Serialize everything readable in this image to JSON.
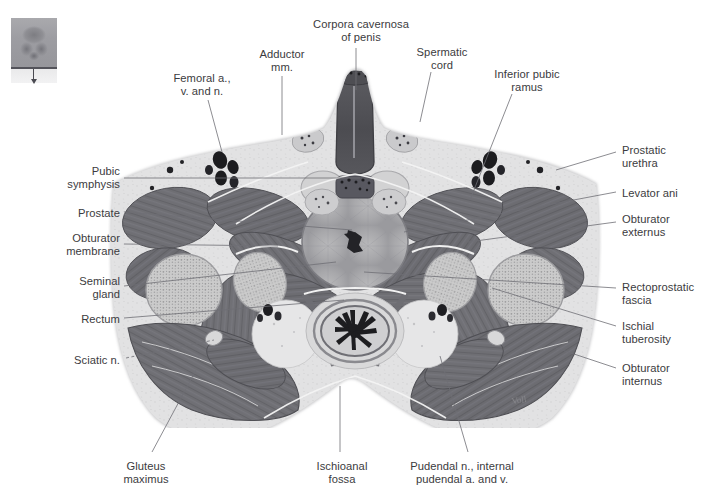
{
  "figure": {
    "type": "anatomical-cross-section",
    "plane": "transverse / axial",
    "modality": "anatomical plate, grayscale",
    "background_color": "#ffffff",
    "label_color": "#3b3b40",
    "leader_line_color": "#6f6f75",
    "tissue_colors": {
      "muscle": "#6e6e73",
      "fat_fascia": "#dcdcdc",
      "bone_marrow": "#c9c9c9",
      "skin_outline": "#b7b7b9",
      "vessel_lumen": "#1f1f22",
      "lumen_dark": "#2a2a2e"
    }
  },
  "thumbnail": {
    "name": "orientation-thumbnail",
    "description": "small pelvis overview with horizontal section line and downward viewing arrow"
  },
  "labels": {
    "top": [
      {
        "id": "corpora-cavernosa",
        "text": "Corpora cavernosa\nof penis",
        "align": "center",
        "x": 311,
        "y": 18,
        "w": 100
      },
      {
        "id": "adductor-mm",
        "text": "Adductor\nmm.",
        "align": "center",
        "x": 248,
        "y": 48,
        "w": 68
      },
      {
        "id": "spermatic-cord",
        "text": "Spermatic\ncord",
        "align": "center",
        "x": 409,
        "y": 46,
        "w": 66
      },
      {
        "id": "inferior-pubic-ramus",
        "text": "Inferior pubic\nramus",
        "align": "center",
        "x": 481,
        "y": 68,
        "w": 92
      },
      {
        "id": "femoral-avn",
        "text": "Femoral a.,\nv. and n.",
        "align": "center",
        "x": 163,
        "y": 72,
        "w": 78
      }
    ],
    "left": [
      {
        "id": "pubic-symphysis",
        "text": "Pubic\nsymphysis",
        "align": "right",
        "x": 38,
        "y": 165,
        "w": 82
      },
      {
        "id": "prostate",
        "text": "Prostate",
        "align": "right",
        "x": 38,
        "y": 207,
        "w": 82
      },
      {
        "id": "obturator-membrane",
        "text": "Obturator\nmembrane",
        "align": "right",
        "x": 30,
        "y": 232,
        "w": 90
      },
      {
        "id": "seminal-gland",
        "text": "Seminal\ngland",
        "align": "right",
        "x": 38,
        "y": 275,
        "w": 82
      },
      {
        "id": "rectum",
        "text": "Rectum",
        "align": "right",
        "x": 38,
        "y": 313,
        "w": 82
      },
      {
        "id": "sciatic-n",
        "text": "Sciatic n.",
        "align": "right",
        "x": 38,
        "y": 354,
        "w": 82
      }
    ],
    "right": [
      {
        "id": "prostatic-urethra",
        "text": "Prostatic\nurethra",
        "align": "left",
        "x": 622,
        "y": 144,
        "w": 84
      },
      {
        "id": "levator-ani",
        "text": "Levator ani",
        "align": "left",
        "x": 622,
        "y": 187,
        "w": 84
      },
      {
        "id": "obturator-externus",
        "text": "Obturator\nexternus",
        "align": "left",
        "x": 622,
        "y": 213,
        "w": 84
      },
      {
        "id": "rectoprostatic-fascia",
        "text": "Rectoprostatic\nfascia",
        "align": "left",
        "x": 622,
        "y": 281,
        "w": 85
      },
      {
        "id": "ischial-tuberosity",
        "text": "Ischial\ntuberosity",
        "align": "left",
        "x": 622,
        "y": 320,
        "w": 84
      },
      {
        "id": "obturator-internus",
        "text": "Obturator\ninternus",
        "align": "left",
        "x": 622,
        "y": 362,
        "w": 84
      }
    ],
    "bottom": [
      {
        "id": "gluteus-maximus",
        "text": "Gluteus\nmaximus",
        "align": "center",
        "x": 110,
        "y": 460,
        "w": 72
      },
      {
        "id": "ischioanal-fossa",
        "text": "Ischioanal\nfossa",
        "align": "center",
        "x": 305,
        "y": 460,
        "w": 74
      },
      {
        "id": "pudendal-bundle",
        "text": "Pudendal n., internal\npudendal a. and v.",
        "align": "center",
        "x": 390,
        "y": 460,
        "w": 144
      }
    ]
  },
  "leaders": [
    {
      "id": "leader-corpora-cavernosa",
      "points": "356,48 356,90",
      "dashed": false
    },
    {
      "id": "leader-adductor-mm",
      "points": "282,76 282,135",
      "dashed": false
    },
    {
      "id": "leader-spermatic-cord",
      "points": "431,72 420,122",
      "dashed": false
    },
    {
      "id": "leader-inferior-pubic-ramus",
      "points": "512,94 470,200",
      "dashed": false
    },
    {
      "id": "leader-femoral-avn",
      "points": "208,100 222,152",
      "dashed": false
    },
    {
      "id": "leader-pubic-symphysis",
      "points": "124,178 360,178",
      "dashed": false
    },
    {
      "id": "leader-prostate",
      "points": "124,212 352,230",
      "dashed": false
    },
    {
      "id": "leader-obturator-membrane",
      "points": "124,244 278,246",
      "dashed": false
    },
    {
      "id": "leader-seminal-gland",
      "points": "124,286 336,262",
      "dashed": false
    },
    {
      "id": "leader-rectum",
      "points": "124,318 344,300",
      "dashed": false
    },
    {
      "id": "leader-sciatic-n",
      "points": "126,358 214,340",
      "dashed": true
    },
    {
      "id": "leader-prostatic-urethra",
      "points": "616,152 556,170",
      "dashed": false
    },
    {
      "id": "leader-levator-ani",
      "points": "616,192 404,232",
      "dashed": false
    },
    {
      "id": "leader-obturator-externus",
      "points": "616,222 468,242",
      "dashed": false
    },
    {
      "id": "leader-rectoprostatic-fascia",
      "points": "616,288 364,272",
      "dashed": false
    },
    {
      "id": "leader-ischial-tuberosity",
      "points": "616,326 492,288",
      "dashed": false
    },
    {
      "id": "leader-obturator-internus",
      "points": "616,368 556,348",
      "dashed": false
    },
    {
      "id": "leader-gluteus-maximus",
      "points": "152,452 196,370",
      "dashed": false
    },
    {
      "id": "leader-ischioanal-fossa",
      "points": "340,452 340,386",
      "dashed": false
    },
    {
      "id": "leader-pudendal-bundle",
      "points": "468,452 440,356",
      "dashed": false
    }
  ]
}
